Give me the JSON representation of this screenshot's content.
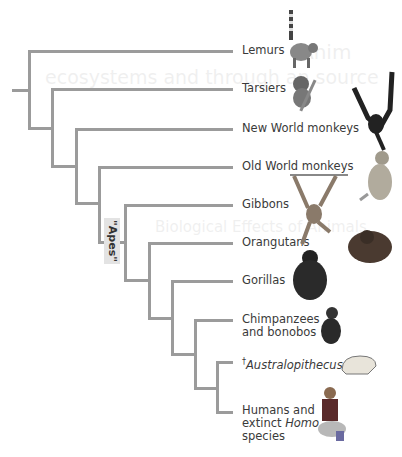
{
  "diagram": {
    "type": "cladogram",
    "group_label": "\"Apes\"",
    "taxa": [
      {
        "name": "Lemurs",
        "icon": "lemur-illustration"
      },
      {
        "name": "Tarsiers",
        "icon": "tarsier-illustration"
      },
      {
        "name": "New World monkeys",
        "icon": "spider-monkey-illustration"
      },
      {
        "name": "Old World monkeys",
        "icon": "macaque-illustration"
      },
      {
        "name": "Gibbons",
        "icon": "gibbon-illustration"
      },
      {
        "name": "Orangutans",
        "icon": "orangutan-illustration"
      },
      {
        "name": "Gorillas",
        "icon": "gorilla-illustration"
      },
      {
        "name_line1": "Chimpanzees",
        "name_line2": "and bonobos",
        "icon": "chimpanzee-illustration"
      },
      {
        "dagger": "†",
        "name": "Australopithecus",
        "extinct": true,
        "icon": "skull-illustration"
      },
      {
        "name_line1": "Humans and",
        "name_line2_a": "extinct ",
        "name_line2_b": "Homo",
        "name_line3": "species",
        "icon": "human-illustration"
      }
    ],
    "colors": {
      "branch": "#9b9b9b",
      "label_box": "#e3e3e3",
      "text": "#3a3a3a"
    }
  },
  "bleed_through": {
    "line1": "Anim",
    "line2": "ecosystems and through an source",
    "line3": "Biological Effects of Animals"
  }
}
